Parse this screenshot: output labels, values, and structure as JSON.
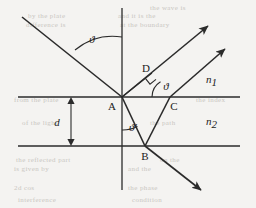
{
  "figure": {
    "background_color": "#f4f3f1",
    "ink_color": "#2b2b2b"
  },
  "labels": {
    "point_a": "A",
    "point_b": "B",
    "point_c": "C",
    "point_d": "D",
    "angle_incidence": "ϑ",
    "angle_at_c": "ϑ",
    "angle_refraction": "ϑ′",
    "thickness": "d",
    "medium_upper": "n",
    "medium_upper_sub": "1",
    "medium_lower": "n",
    "medium_lower_sub": "2"
  },
  "chart_data": {
    "type": "diagram",
    "points": [
      {
        "id": "A",
        "x": 122,
        "y": 97,
        "label": "A",
        "description": "entry point on upper interface"
      },
      {
        "id": "B",
        "x": 145,
        "y": 146,
        "label": "B",
        "description": "internal reflection point on lower interface"
      },
      {
        "id": "C",
        "x": 170,
        "y": 97,
        "label": "C",
        "description": "exit point on upper interface"
      },
      {
        "id": "D",
        "x": 151,
        "y": 74,
        "label": "D",
        "description": "foot of perpendicular from A to ray leaving C"
      }
    ],
    "interfaces": [
      {
        "id": "upper",
        "y": 97,
        "x_start": 18,
        "x_end": 240
      },
      {
        "id": "lower",
        "y": 146,
        "x_start": 18,
        "x_end": 240
      }
    ],
    "normal_line": {
      "x": 122,
      "y_start": 8,
      "y_end": 190
    },
    "rays": [
      {
        "id": "incident",
        "from": [
          22,
          17
        ],
        "to": [
          122,
          97
        ],
        "arrow_at_end": false
      },
      {
        "id": "reflected-at-A",
        "from": [
          122,
          97
        ],
        "to": [
          213,
          22
        ],
        "arrow_at_end": true
      },
      {
        "id": "refracted-A-to-B",
        "from": [
          122,
          97
        ],
        "to": [
          145,
          146
        ],
        "arrow_at_end": false
      },
      {
        "id": "internal-B-to-C",
        "from": [
          145,
          146
        ],
        "to": [
          170,
          97
        ],
        "arrow_at_end": false
      },
      {
        "id": "exit-at-C",
        "from": [
          170,
          97
        ],
        "to": [
          229,
          45
        ],
        "arrow_at_end": true
      },
      {
        "id": "transmitted-at-B",
        "from": [
          145,
          146
        ],
        "to": [
          205,
          194
        ],
        "arrow_at_end": true
      },
      {
        "id": "perpendicular-A-to-D",
        "from": [
          122,
          97
        ],
        "to": [
          151,
          74
        ],
        "arrow_at_end": false
      }
    ],
    "angles": [
      {
        "id": "theta-incidence",
        "at": [
          122,
          97
        ],
        "label": "ϑ",
        "label_pos": [
          86,
          38
        ],
        "between": "incident ray and upward normal"
      },
      {
        "id": "theta-at-C",
        "at": [
          170,
          97
        ],
        "label": "ϑ",
        "label_pos": [
          165,
          64
        ],
        "between": "exit ray at C and interface"
      },
      {
        "id": "theta-prime",
        "at": [
          122,
          97
        ],
        "label": "ϑ′",
        "label_pos": [
          110,
          133
        ],
        "between": "refracted ray and downward normal"
      }
    ],
    "right_angle_marks": [
      {
        "id": "at-D",
        "at": [
          151,
          74
        ],
        "size": 8
      }
    ],
    "dimension": {
      "id": "thickness-d",
      "label": "d",
      "label_pos": [
        55,
        124
      ],
      "x": 71,
      "y_top": 97,
      "y_bottom": 146,
      "double_headed": true
    },
    "media_labels": [
      {
        "id": "n1",
        "text": "n₁",
        "base": "n",
        "sub": "1",
        "pos": [
          212,
          80
        ],
        "region": "above upper interface"
      },
      {
        "id": "n2",
        "text": "n₂",
        "base": "n",
        "sub": "2",
        "pos": [
          212,
          122
        ],
        "region": "below upper interface"
      }
    ]
  },
  "background_text": [
    {
      "text": "the wave is",
      "x": 150,
      "y": 4
    },
    {
      "text": "by the plate",
      "x": 28,
      "y": 12
    },
    {
      "text": "and it is the",
      "x": 118,
      "y": 12
    },
    {
      "text": "difference is",
      "x": 26,
      "y": 21
    },
    {
      "text": "at the boundary",
      "x": 120,
      "y": 21
    },
    {
      "text": "from the plate",
      "x": 14,
      "y": 96
    },
    {
      "text": "the index",
      "x": 196,
      "y": 96
    },
    {
      "text": "of the light",
      "x": 22,
      "y": 119
    },
    {
      "text": "the path",
      "x": 150,
      "y": 119
    },
    {
      "text": "the reflected part",
      "x": 16,
      "y": 156
    },
    {
      "text": "on the",
      "x": 160,
      "y": 156
    },
    {
      "text": "is given by",
      "x": 14,
      "y": 165
    },
    {
      "text": "and the",
      "x": 128,
      "y": 165
    },
    {
      "text": "2d cos",
      "x": 14,
      "y": 184
    },
    {
      "text": "the phase",
      "x": 128,
      "y": 184
    },
    {
      "text": "interference",
      "x": 18,
      "y": 196
    },
    {
      "text": "condition",
      "x": 132,
      "y": 196
    }
  ]
}
